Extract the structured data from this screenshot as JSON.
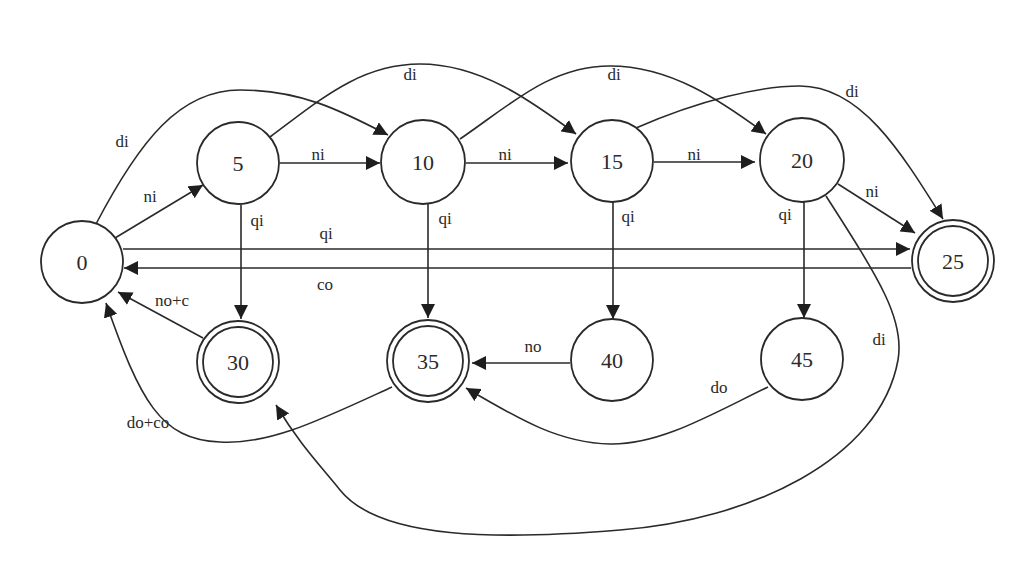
{
  "diagram": {
    "type": "finite-state-machine",
    "nodes": [
      {
        "id": "0",
        "label": "0",
        "accepting": false
      },
      {
        "id": "5",
        "label": "5",
        "accepting": false
      },
      {
        "id": "10",
        "label": "10",
        "accepting": false
      },
      {
        "id": "15",
        "label": "15",
        "accepting": false
      },
      {
        "id": "20",
        "label": "20",
        "accepting": false
      },
      {
        "id": "25",
        "label": "25",
        "accepting": true
      },
      {
        "id": "30",
        "label": "30",
        "accepting": true
      },
      {
        "id": "35",
        "label": "35",
        "accepting": true
      },
      {
        "id": "40",
        "label": "40",
        "accepting": false
      },
      {
        "id": "45",
        "label": "45",
        "accepting": false
      }
    ],
    "edges": [
      {
        "from": "0",
        "to": "5",
        "label": "ni"
      },
      {
        "from": "0",
        "to": "10",
        "label": "di"
      },
      {
        "from": "0",
        "to": "25",
        "label": "qi"
      },
      {
        "from": "5",
        "to": "10",
        "label": "ni"
      },
      {
        "from": "5",
        "to": "15",
        "label": "di"
      },
      {
        "from": "5",
        "to": "30",
        "label": "qi"
      },
      {
        "from": "10",
        "to": "15",
        "label": "ni"
      },
      {
        "from": "10",
        "to": "20",
        "label": "di"
      },
      {
        "from": "10",
        "to": "35",
        "label": "qi"
      },
      {
        "from": "15",
        "to": "20",
        "label": "ni"
      },
      {
        "from": "15",
        "to": "25",
        "label": "di"
      },
      {
        "from": "15",
        "to": "40",
        "label": "qi"
      },
      {
        "from": "20",
        "to": "25",
        "label": "ni"
      },
      {
        "from": "20",
        "to": "45",
        "label": "qi"
      },
      {
        "from": "20",
        "to": "30",
        "label": "di"
      },
      {
        "from": "25",
        "to": "0",
        "label": "co"
      },
      {
        "from": "30",
        "to": "0",
        "label": "no+c"
      },
      {
        "from": "35",
        "to": "0",
        "label": "do+co"
      },
      {
        "from": "40",
        "to": "35",
        "label": "no"
      },
      {
        "from": "45",
        "to": "35",
        "label": "do"
      }
    ]
  }
}
